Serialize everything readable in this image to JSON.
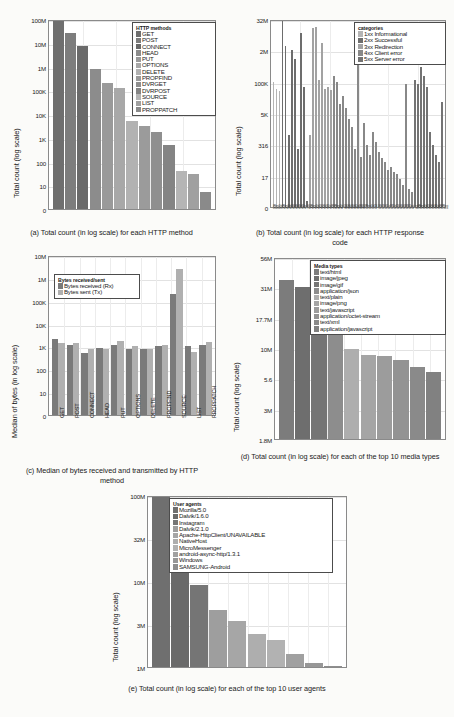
{
  "figure": {
    "panels": [
      {
        "id": "a",
        "caption": "(a) Total count (in log scale) for each HTTP method",
        "ylabel": "Total count (log scale)",
        "legend_title": "HTTP methods"
      },
      {
        "id": "b",
        "caption": "(b) Total count (in log scale) for each HTTP response code",
        "ylabel": "Total count (log scale)",
        "legend_title": "categories"
      },
      {
        "id": "c",
        "caption": "(c) Median of bytes received and transmitted by HTTP method",
        "ylabel": "Median of bytes (in log scale)",
        "legend_title": "Bytes received/sent"
      },
      {
        "id": "d",
        "caption": "(d) Total count (in log scale) for each of the top 10 media types",
        "ylabel": "Total count (log scale)",
        "legend_title": "Media types"
      },
      {
        "id": "e",
        "caption": "(e) Total count (in log scale) for each of the top 10 user agents",
        "ylabel": "Total count (log scale)",
        "legend_title": "User agents"
      }
    ]
  },
  "chart_data": [
    {
      "type": "bar",
      "panel": "a",
      "title": "(a) Total count (in log scale) for each HTTP method",
      "xlabel": "",
      "ylabel": "Total count (log scale)",
      "yscale": "log",
      "ytick_labels": [
        "0",
        "10",
        "100",
        "1K",
        "10K",
        "100K",
        "1M",
        "10M",
        "100M"
      ],
      "ytick_values": [
        0,
        10,
        100,
        1000,
        10000,
        100000,
        1000000,
        10000000,
        100000000
      ],
      "ylim": [
        0,
        300000000
      ],
      "grid": true,
      "legend_position": "upper-right",
      "legend_title": "HTTP methods",
      "categories": [
        "GET",
        "POST",
        "CONNECT",
        "HEAD",
        "PUT",
        "OPTIONS",
        "DELETE",
        "PROPFIND",
        "DVRGET",
        "DVRPOST",
        "SOURCE",
        "LIST",
        "PROPPATCH"
      ],
      "values": [
        200000000,
        25000000,
        7000000,
        800000,
        200000,
        130000,
        5000,
        3000,
        1700,
        500,
        40,
        30,
        7
      ],
      "colors": [
        "#6f6f6f",
        "#7d7d7d",
        "#6a6a6a",
        "#8c8c8c",
        "#9a9a9a",
        "#a8a8a8",
        "#b2b2b2",
        "#9b9b9b",
        "#8f8f8f",
        "#848484",
        "#b5b5b5",
        "#a0a0a0",
        "#8a8a8a"
      ]
    },
    {
      "type": "bar",
      "panel": "b",
      "title": "(b) Total count (in log scale) for each HTTP response code",
      "xlabel": "",
      "ylabel": "Total count (log scale)",
      "yscale": "log",
      "ytick_labels": [
        "0",
        "17",
        "316",
        "5K",
        "100K",
        "2M",
        "32M"
      ],
      "ytick_values": [
        0,
        17,
        316,
        5000,
        100000,
        2000000,
        32000000
      ],
      "ylim": [
        0,
        120000000
      ],
      "grid": true,
      "legend_position": "upper-right",
      "legend_title": "categories",
      "legend_entries": [
        "1xx Informational",
        "2xx Successful",
        "3xx Redirection",
        "4xx Client error",
        "5xx Server error"
      ],
      "legend_colors": [
        "#b4b4b4",
        "#6d6d6d",
        "#a2a2a2",
        "#888888",
        "#737373"
      ],
      "categories": [
        "100",
        "101",
        "102",
        "200",
        "201",
        "202",
        "203",
        "204",
        "205",
        "206",
        "207",
        "226",
        "300",
        "301",
        "302",
        "303",
        "304",
        "305",
        "307",
        "308",
        "400",
        "401",
        "402",
        "403",
        "404",
        "405",
        "406",
        "407",
        "408",
        "409",
        "410",
        "411",
        "412",
        "413",
        "414",
        "415",
        "416",
        "417",
        "418",
        "422",
        "423",
        "424",
        "426",
        "428",
        "429",
        "431",
        "451",
        "500",
        "501",
        "502",
        "503",
        "504",
        "505",
        "507",
        "508",
        "510",
        "511"
      ],
      "values": [
        100000,
        50000,
        40000,
        70000000,
        3000000,
        700,
        2000000,
        900000,
        200,
        9000000,
        60000,
        3,
        700,
        15000000,
        16000000,
        120000,
        4000000,
        50000,
        60000,
        45000,
        180000,
        95000,
        12000,
        25000,
        8000,
        3000,
        1500,
        200,
        900000,
        100,
        2000,
        300,
        120,
        900,
        400,
        150,
        90,
        60,
        30,
        40,
        25,
        20,
        15,
        12,
        80000,
        10,
        8,
        120000,
        80000,
        400000,
        180000,
        60000,
        900,
        300,
        120,
        60,
        15000
      ],
      "series_assignment": [
        "1xx",
        "1xx",
        "1xx",
        "2xx",
        "2xx",
        "2xx",
        "2xx",
        "2xx",
        "2xx",
        "2xx",
        "2xx",
        "2xx",
        "3xx",
        "3xx",
        "3xx",
        "3xx",
        "3xx",
        "3xx",
        "3xx",
        "3xx",
        "4xx",
        "4xx",
        "4xx",
        "4xx",
        "4xx",
        "4xx",
        "4xx",
        "4xx",
        "4xx",
        "4xx",
        "4xx",
        "4xx",
        "4xx",
        "4xx",
        "4xx",
        "4xx",
        "4xx",
        "4xx",
        "4xx",
        "4xx",
        "4xx",
        "4xx",
        "4xx",
        "4xx",
        "4xx",
        "4xx",
        "4xx",
        "5xx",
        "5xx",
        "5xx",
        "5xx",
        "5xx",
        "5xx",
        "5xx",
        "5xx",
        "5xx",
        "5xx"
      ]
    },
    {
      "type": "bar",
      "panel": "c",
      "title": "(c) Median of bytes received and transmitted by HTTP method",
      "xlabel": "",
      "ylabel": "Median of bytes (in log scale)",
      "yscale": "log",
      "ytick_labels": [
        "0",
        "10",
        "100",
        "1K",
        "10K",
        "100K",
        "1M",
        "10M"
      ],
      "ytick_values": [
        0,
        10,
        100,
        1000,
        10000,
        100000,
        1000000,
        10000000
      ],
      "ylim": [
        0,
        10000000
      ],
      "grid": true,
      "legend_position": "upper-left",
      "legend_title": "Bytes received/sent",
      "categories": [
        "GET",
        "POST",
        "CONNECT",
        "HEAD",
        "PUT",
        "OPTIONS",
        "DELETE",
        "PROPFIND",
        "SOURCE",
        "LIST",
        "PROPPATCH"
      ],
      "series": [
        {
          "name": "Bytes received (Rx)",
          "color": "#7a7a7a",
          "values": [
            2200,
            1100,
            500,
            850,
            1200,
            800,
            800,
            1050,
            200000,
            1050,
            1200
          ]
        },
        {
          "name": "Bytes sent (Tx)",
          "color": "#b0b0b0",
          "values": [
            1400,
            1350,
            750,
            800,
            1700,
            1050,
            800,
            1100,
            2500000,
            600,
            1600
          ]
        }
      ]
    },
    {
      "type": "bar",
      "panel": "d",
      "title": "(d) Total count (in log scale) for each of the top 10 media types",
      "xlabel": "",
      "ylabel": "Total count (log scale)",
      "yscale": "log",
      "ytick_labels": [
        "1.8M",
        "3M",
        "5.6",
        "10M",
        "17.7M",
        "31M",
        "56M"
      ],
      "ytick_values": [
        1800000,
        3000000,
        5600000,
        10000000,
        17700000,
        31000000,
        56000000
      ],
      "ylim": [
        1800000,
        75000000
      ],
      "grid": true,
      "legend_position": "upper-right",
      "legend_title": "Media types",
      "categories": [
        "text/html",
        "image/jpeg",
        "image/gif",
        "application/json",
        "text/plain",
        "image/png",
        "text/javascript",
        "application/octet-stream",
        "text/xml",
        "application/javascript"
      ],
      "values": [
        36000000,
        31500000,
        18000000,
        15000000,
        9800000,
        8800000,
        8600000,
        8000000,
        6900000,
        6300000
      ],
      "colors": [
        "#7c7c7c",
        "#6e6e6e",
        "#757575",
        "#8d8d8d",
        "#aeaeae",
        "#a5a5a5",
        "#9c9c9c",
        "#939393",
        "#8a8a8a",
        "#818181"
      ]
    },
    {
      "type": "bar",
      "panel": "e",
      "title": "(e) Total count (in log scale) for each of the top 10 user agents",
      "xlabel": "",
      "ylabel": "Total count (log scale)",
      "yscale": "log",
      "ytick_labels": [
        "1M",
        "3M",
        "10M",
        "32M",
        "100M"
      ],
      "ytick_values": [
        1000000,
        3000000,
        10000000,
        32000000,
        100000000
      ],
      "ylim": [
        1000000,
        170000000
      ],
      "grid": true,
      "legend_position": "upper-right",
      "legend_title": "User agents",
      "categories": [
        "Mozilla/5.0",
        "Dalvik/1.6.0",
        "Instagram",
        "Dalvik/2.1.0",
        "Apache-HttpClient/UNAVAILABLE",
        "NativeHost",
        "MicroMessenger",
        "android-async-http/1.3.1",
        "Windows",
        "SAMSUNG-Android"
      ],
      "values": [
        110000000,
        20000000,
        9000000,
        4500000,
        3300000,
        2300000,
        2000000,
        1400000,
        1100000,
        1020000
      ],
      "colors": [
        "#6f6f6f",
        "#6a6a6a",
        "#757575",
        "#9e9e9e",
        "#a6a6a6",
        "#aeaeae",
        "#b2b2b2",
        "#a0a0a0",
        "#979797",
        "#8e8e8e"
      ]
    }
  ]
}
